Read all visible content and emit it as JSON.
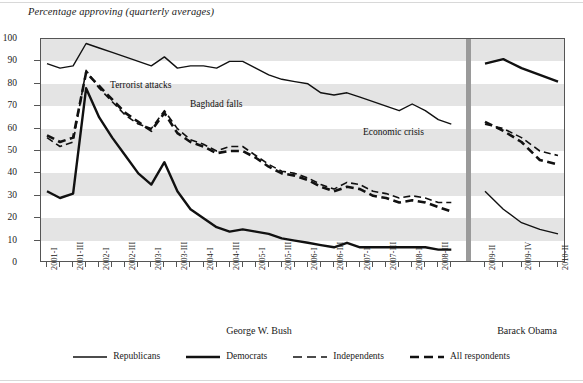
{
  "chart_data": {
    "type": "line",
    "title": "Percentage approving (quarterly averages)",
    "xlabel": "",
    "ylabel": "",
    "ylim": [
      0,
      100
    ],
    "ytick_step": 10,
    "yticks": [
      0,
      10,
      20,
      30,
      40,
      50,
      60,
      70,
      80,
      90,
      100
    ],
    "grid": "horizontal alternating gray bands every 10 units",
    "legend_position": "bottom-center",
    "x": [
      "2001-I",
      "2001-II",
      "2001-III",
      "2001-IV",
      "2002-I",
      "2002-II",
      "2002-III",
      "2002-IV",
      "2003-I",
      "2003-II",
      "2003-III",
      "2003-IV",
      "2004-I",
      "2004-II",
      "2004-III",
      "2004-IV",
      "2005-I",
      "2005-II",
      "2005-III",
      "2005-IV",
      "2006-I",
      "2006-II",
      "2006-III",
      "2006-IV",
      "2007-I",
      "2007-II",
      "2007-III",
      "2007-IV",
      "2008-I",
      "2008-II",
      "2008-III",
      "2008-IV",
      "2009-II",
      "2009-III",
      "2009-IV",
      "2010-I",
      "2010-II"
    ],
    "xtick_labels_shown": [
      "2001-I",
      "2001-III",
      "2002-I",
      "2002-III",
      "2003-I",
      "2003-III",
      "2004-I",
      "2004-III",
      "2005-I",
      "2005-III",
      "2006-I",
      "2006-III",
      "2007-I",
      "2007-III",
      "2008-I",
      "2008-III",
      "2009-II",
      "2009-IV",
      "2010-II"
    ],
    "series": [
      {
        "name": "Republicans",
        "style": "thin-solid",
        "bush_values": [
          89,
          87,
          88,
          98,
          96,
          94,
          92,
          90,
          88,
          92,
          87,
          88,
          88,
          87,
          90,
          90,
          87,
          84,
          82,
          81,
          80,
          76,
          75,
          76,
          74,
          72,
          70,
          68,
          71,
          68,
          64,
          62
        ],
        "obama_values": [
          32,
          24,
          18,
          15,
          13
        ]
      },
      {
        "name": "Democrats",
        "style": "thick-solid",
        "bush_values": [
          32,
          29,
          31,
          78,
          65,
          56,
          48,
          40,
          35,
          45,
          32,
          24,
          20,
          16,
          14,
          15,
          14,
          13,
          11,
          10,
          9,
          8,
          7,
          9,
          7,
          7,
          7,
          7,
          7,
          7,
          6,
          6
        ],
        "obama_values": [
          89,
          91,
          87,
          84,
          81
        ]
      },
      {
        "name": "Independents",
        "style": "thin-dashed",
        "bush_values": [
          56,
          52,
          54,
          86,
          78,
          72,
          66,
          62,
          60,
          68,
          60,
          55,
          53,
          50,
          52,
          52,
          48,
          44,
          41,
          40,
          38,
          35,
          33,
          36,
          35,
          32,
          31,
          29,
          30,
          29,
          27,
          27
        ],
        "obama_values": [
          62,
          60,
          56,
          50,
          48
        ]
      },
      {
        "name": "All respondents",
        "style": "thick-dashed",
        "bush_values": [
          57,
          54,
          56,
          85,
          79,
          73,
          67,
          63,
          59,
          67,
          58,
          54,
          52,
          49,
          50,
          50,
          47,
          43,
          40,
          39,
          37,
          34,
          32,
          34,
          33,
          30,
          29,
          27,
          28,
          27,
          25,
          23
        ],
        "obama_values": [
          63,
          59,
          54,
          46,
          44
        ]
      }
    ],
    "annotations": [
      {
        "text": "Terrorist attacks",
        "x_px": 110,
        "y_px": 80
      },
      {
        "text": "Baghdad falls",
        "x_px": 190,
        "y_px": 99
      },
      {
        "text": "Economic crisis",
        "x_px": 363,
        "y_px": 127
      }
    ],
    "presidents": [
      {
        "label": "George W. Bush",
        "center_px": 259
      },
      {
        "label": "Barack Obama",
        "center_px": 527
      }
    ]
  },
  "legend": {
    "items": [
      {
        "label": "Republicans",
        "style": "thin-solid"
      },
      {
        "label": "Democrats",
        "style": "thick-solid"
      },
      {
        "label": "Independents",
        "style": "thin-dashed"
      },
      {
        "label": "All respondents",
        "style": "thick-dashed"
      }
    ]
  },
  "colors": {
    "line": "#111111",
    "band": "#e4e4e4",
    "frame": "#555555",
    "divider": "#9a9a9a"
  }
}
